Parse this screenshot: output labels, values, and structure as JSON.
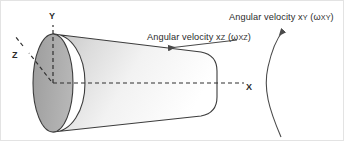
{
  "figure": {
    "background_color": "#ffffff",
    "border_color": "#e3e3e3",
    "width": 344,
    "height": 141
  },
  "labels": {
    "angular_velocity_xy": {
      "prefix": "Angular velocity x",
      "sub1": "Y",
      "paren_open": " (ω",
      "sub2": "XY",
      "paren_close": ")",
      "full_text": "Angular velocity xY (ωXY)"
    },
    "angular_velocity_xz": {
      "prefix": "Angular velocity x",
      "sub1": "Z",
      "paren_open": " (ω",
      "sub2": "XZ",
      "paren_close": ")",
      "full_text": "Angular velocity xZ (ωXZ)"
    },
    "axis_x": "X",
    "axis_y": "Y",
    "axis_z": "Z"
  },
  "cone": {
    "base_fill": "#a9a9a9",
    "base_stroke": "#3c3c3c",
    "body_gradient_start": "#c9c9c9",
    "body_gradient_end": "#ffffff",
    "body_stroke": "#3c3c3c"
  },
  "axes": {
    "stroke": "#2f2f2f",
    "dash": "4 3",
    "origin_x": 52,
    "origin_y": 82
  },
  "arrows": {
    "xz_arrow_color": "#4a4a4a",
    "xy_arrow_color": "#4a4a4a",
    "xz_direction": "left",
    "xy_direction": "up"
  }
}
